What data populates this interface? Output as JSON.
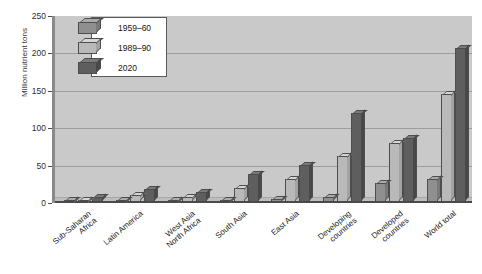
{
  "chart_data": {
    "type": "bar",
    "title": "",
    "subtitle": "",
    "xlabel": "",
    "ylabel": "Million nutrient tons",
    "ylim": [
      0,
      250
    ],
    "yticks": [
      0,
      50,
      100,
      150,
      200,
      250
    ],
    "grid": true,
    "legend_position": "top-left",
    "categories": [
      "Sub-Saharan\nAfrica",
      "Latin America",
      "West Asia\nNorth Africa",
      "South Asia",
      "East Asia",
      "Developing\ncountries",
      "Developed\ncountries",
      "World total"
    ],
    "series": [
      {
        "name": "1959–60",
        "color": "#8f8f8f",
        "values": [
          0.3,
          1.5,
          0.6,
          1.2,
          2.5,
          5,
          25,
          30
        ]
      },
      {
        "name": "1989–90",
        "color": "#b9b9b9",
        "values": [
          1.5,
          8,
          6,
          18,
          30,
          63,
          80,
          148
        ]
      },
      {
        "name": "2020",
        "color": "#5e5e5e",
        "values": [
          6,
          17,
          13,
          38,
          50,
          122,
          87,
          213
        ]
      }
    ]
  },
  "colors": {
    "plot_background": "#c9c9c9",
    "page_background": "#ffffff",
    "axis": "#4a4a4a",
    "gridline": "#9d9d9d",
    "series_1959_60": "#8f8f8f",
    "series_1989_90": "#b9b9b9",
    "series_2020": "#5e5e5e"
  }
}
